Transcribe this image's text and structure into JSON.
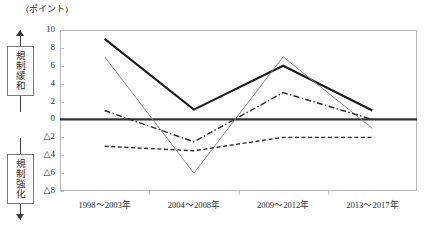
{
  "chart_data": {
    "type": "line",
    "title": "",
    "subtitle": "",
    "unit_label": "(ポイント)",
    "xlabel": "",
    "ylabel": "",
    "categories": [
      "1998〜2003年",
      "2004〜2008年",
      "2009〜2012年",
      "2013〜2017年"
    ],
    "ylim": [
      -8,
      10
    ],
    "ytick_values": [
      10,
      8,
      6,
      4,
      2,
      0,
      -2,
      -4,
      -6,
      -8
    ],
    "ytick_labels": [
      "10",
      "8",
      "6",
      "4",
      "2",
      "0",
      "△2",
      "△4",
      "△6",
      "△8"
    ],
    "negative_prefix": "△",
    "grid": false,
    "legend": "none",
    "zero_line": true,
    "series": [
      {
        "name": "series-thick-solid",
        "style": "solid-thick",
        "color": "#1a1a1a",
        "width": 2.1,
        "values": [
          9.0,
          1.1,
          6.0,
          1.0
        ]
      },
      {
        "name": "series-thin-solid",
        "style": "solid-thin",
        "color": "#8a8a8a",
        "width": 1.0,
        "values": [
          7.0,
          -6.0,
          7.0,
          -1.0
        ]
      },
      {
        "name": "series-dash-dot",
        "style": "dash-dot",
        "color": "#2a2a2a",
        "width": 1.4,
        "values": [
          1.0,
          -2.5,
          3.0,
          0.0
        ]
      },
      {
        "name": "series-dashed",
        "style": "dashed",
        "color": "#2a2a2a",
        "width": 1.4,
        "values": [
          -3.0,
          -3.5,
          -2.0,
          -2.0
        ]
      }
    ]
  },
  "annotations": {
    "up": {
      "label": "規制緩和",
      "direction": "up"
    },
    "down": {
      "label": "規制強化",
      "direction": "down"
    }
  },
  "plot": {
    "left": 60,
    "top": 30,
    "width": 357,
    "height": 161
  }
}
